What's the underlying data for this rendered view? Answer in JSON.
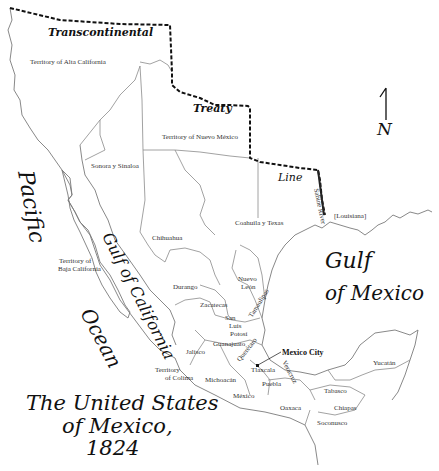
{
  "map": {
    "title_lines": [
      "The United States",
      "of Mexico,",
      "1824"
    ],
    "compass": {
      "arrow": "north-arrow",
      "label": "N"
    },
    "treaty_line_words": [
      "Transcontinental",
      "Treaty",
      "Line"
    ],
    "river_label": "Sabine River",
    "water_bodies": {
      "pacific": [
        "Pacific",
        "Ocean"
      ],
      "gulf_california": "Gulf of California",
      "gulf_mexico": [
        "Gulf",
        "of Mexico"
      ]
    },
    "regions": {
      "alta_california": "Territory of Alta California",
      "nuevo_mexico": "Territory of Nuevo México",
      "sonora": "Sonora y Sinaloa",
      "coahuila": "Coahuila y Texas",
      "louisiana": "[Louisiana]",
      "chihuahua": "Chihuahua",
      "baja_1": "Territory of",
      "baja_2": "Baja California",
      "durango": "Durango",
      "nuevo_leon_1": "Nuevo",
      "nuevo_leon_2": "León",
      "tamaulipas": "Tamaulipas",
      "zacatecas": "Zacatecas",
      "slp_1": "San",
      "slp_2": "Luis",
      "slp_3": "Potosí",
      "guanajuato": "Guanajuato",
      "queretaro": "Querétaro",
      "jalisco": "Jalisco",
      "colima_1": "Territory",
      "colima_2": "of Colima",
      "michoacan": "Michoacán",
      "mexico": "México",
      "mexico_city": "Mexico City",
      "tlaxcala": "Tlaxcala",
      "veracruz": "Veracruz",
      "puebla": "Puebla",
      "oaxaca": "Oaxaca",
      "tabasco": "Tabasco",
      "chiapas": "Chiapas",
      "soconusco": "Soconusco",
      "yucatan": "Yucatán"
    }
  }
}
